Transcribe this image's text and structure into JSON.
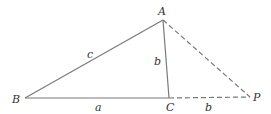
{
  "diagram": {
    "type": "triangle-geometry",
    "colors": {
      "line": "#7a7a7a",
      "text": "#333333",
      "background": "#ffffff"
    },
    "vertices": {
      "A": {
        "label": "A",
        "x": 163,
        "y": 20
      },
      "B": {
        "label": "B",
        "x": 25,
        "y": 98
      },
      "C": {
        "label": "C",
        "x": 169,
        "y": 98
      },
      "P": {
        "label": "P",
        "x": 250,
        "y": 97
      }
    },
    "edges": [
      {
        "from": "A",
        "to": "B",
        "style": "solid",
        "label": "c"
      },
      {
        "from": "B",
        "to": "C",
        "style": "solid",
        "label": "a"
      },
      {
        "from": "A",
        "to": "C",
        "style": "solid",
        "label": "b"
      },
      {
        "from": "C",
        "to": "P",
        "style": "dashed",
        "label": "b"
      },
      {
        "from": "A",
        "to": "P",
        "style": "dashed",
        "label": ""
      }
    ],
    "edge_labels": {
      "AB": "c",
      "BC": "a",
      "AC": "b",
      "CP": "b"
    }
  }
}
